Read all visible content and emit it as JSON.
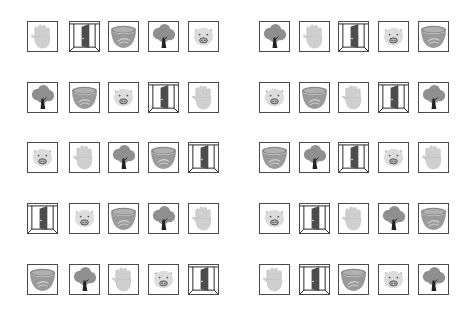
{
  "layout": {
    "left_x": [
      27,
      69,
      108,
      148,
      188
    ],
    "right_x": [
      259,
      299,
      338,
      378,
      418
    ],
    "row_y": [
      21,
      82,
      142,
      203,
      264
    ],
    "cell_size": 31
  },
  "colors": {
    "border": "#4a4a4a",
    "hand": "#cfcfcf",
    "hand_line": "#bdbdbd",
    "door_frame": "#222222",
    "door_panel": "#4d4d4d",
    "bowl_rim": "#8a8a8a",
    "bowl_body": "#9a9a9a",
    "bowl_soup": "#b0b0b0",
    "tree_leaves": "#8f8f8f",
    "tree_trunk": "#222222",
    "pig_face": "#dcdcdc",
    "pig_snout": "#b5b5b5"
  },
  "left_grid": [
    [
      "hand",
      "door",
      "bowl",
      "tree",
      "pig"
    ],
    [
      "tree",
      "bowl",
      "pig",
      "door",
      "hand"
    ],
    [
      "pig",
      "hand",
      "tree",
      "bowl",
      "door"
    ],
    [
      "door",
      "pig",
      "bowl",
      "tree",
      "hand"
    ],
    [
      "bowl",
      "tree",
      "hand",
      "pig",
      "door"
    ]
  ],
  "right_grid": [
    [
      "tree",
      "hand",
      "door",
      "pig",
      "bowl"
    ],
    [
      "pig",
      "bowl",
      "hand",
      "door",
      "tree"
    ],
    [
      "bowl",
      "tree",
      "door",
      "pig",
      "hand"
    ],
    [
      "pig",
      "door",
      "hand",
      "tree",
      "bowl"
    ],
    [
      "hand",
      "door",
      "bowl",
      "pig",
      "tree"
    ]
  ]
}
